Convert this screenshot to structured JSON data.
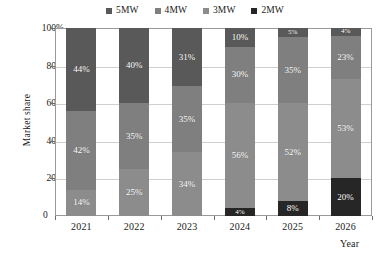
{
  "chart_data": {
    "type": "bar",
    "subtype": "stacked-bar-100",
    "title": "",
    "xlabel": "Year",
    "ylabel": "Market share",
    "ylim": [
      0,
      100
    ],
    "yticks": [
      "0",
      "20%",
      "40%",
      "60%",
      "80%",
      "100%"
    ],
    "ytick_values": [
      0,
      20,
      40,
      60,
      80,
      100
    ],
    "grid": true,
    "legend_position": "top-center",
    "categories": [
      "2021",
      "2022",
      "2023",
      "2024",
      "2025",
      "2026"
    ],
    "stack_order_top_to_bottom": [
      "5MW",
      "4MW",
      "3MW",
      "2MW"
    ],
    "series": [
      {
        "name": "5MW",
        "color": "#595959",
        "values": [
          44,
          40,
          31,
          10,
          5,
          4
        ]
      },
      {
        "name": "4MW",
        "color": "#7f7f7f",
        "values": [
          42,
          35,
          35,
          30,
          35,
          23
        ]
      },
      {
        "name": "3MW",
        "color": "#8c8c8c",
        "values": [
          14,
          25,
          34,
          56,
          52,
          53
        ]
      },
      {
        "name": "2MW",
        "color": "#262626",
        "values": [
          0,
          0,
          0,
          4,
          8,
          20
        ]
      }
    ],
    "labels": {
      "2021": {
        "5MW": "44%",
        "4MW": "42%",
        "3MW": "14%",
        "2MW": ""
      },
      "2022": {
        "5MW": "40%",
        "4MW": "35%",
        "3MW": "25%",
        "2MW": ""
      },
      "2023": {
        "5MW": "31%",
        "4MW": "35%",
        "3MW": "34%",
        "2MW": ""
      },
      "2024": {
        "5MW": "10%",
        "4MW": "30%",
        "3MW": "56%",
        "2MW": "4%"
      },
      "2025": {
        "5MW": "5%",
        "4MW": "35%",
        "3MW": "52%",
        "2MW": "8%"
      },
      "2026": {
        "5MW": "4%",
        "4MW": "23%",
        "3MW": "53%",
        "2MW": "20%"
      }
    }
  },
  "legend": {
    "items": [
      {
        "label": "5MW",
        "color": "#595959"
      },
      {
        "label": "4MW",
        "color": "#7f7f7f"
      },
      {
        "label": "3MW",
        "color": "#8c8c8c"
      },
      {
        "label": "2MW",
        "color": "#262626"
      }
    ]
  },
  "axes": {
    "y_title": "Market share",
    "x_title": "Year",
    "y_ticks": [
      "100%",
      "80%",
      "60%",
      "40%",
      "20%",
      "0"
    ],
    "x_ticks": [
      "2021",
      "2022",
      "2023",
      "2024",
      "2025",
      "2026"
    ]
  },
  "colors": {
    "series_5mw": "#595959",
    "series_4mw": "#7f7f7f",
    "series_3mw": "#8c8c8c",
    "series_2mw": "#262626",
    "grid": "#cfcfcf",
    "frame": "#9a9a9a",
    "background": "#ffffff",
    "text": "#1a1a1a"
  }
}
